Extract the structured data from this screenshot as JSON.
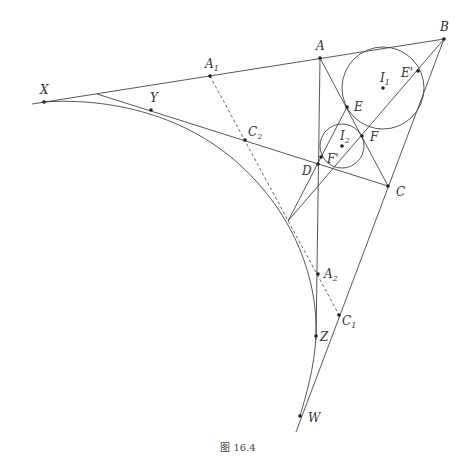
{
  "figure": {
    "caption": "图 16.4",
    "points": {
      "A": {
        "label": "A",
        "sub": "",
        "x": 320,
        "y": 58,
        "lx": 316,
        "ly": 50
      },
      "B": {
        "label": "B",
        "sub": "",
        "x": 444,
        "y": 39,
        "lx": 440,
        "ly": 31
      },
      "C": {
        "label": "C",
        "sub": "",
        "x": 388,
        "y": 186,
        "lx": 396,
        "ly": 196
      },
      "D": {
        "label": "D",
        "sub": "",
        "x": 318,
        "y": 164,
        "lx": 302,
        "ly": 175
      },
      "E": {
        "label": "E",
        "sub": "",
        "x": 347,
        "y": 107,
        "lx": 354,
        "ly": 111
      },
      "F": {
        "label": "F",
        "sub": "",
        "x": 362,
        "y": 136,
        "lx": 370,
        "ly": 141
      },
      "E'": {
        "label": "E'",
        "sub": "",
        "x": 418,
        "y": 71,
        "lx": 401,
        "ly": 77
      },
      "F'": {
        "label": "F'",
        "sub": "",
        "x": 321,
        "y": 157,
        "lx": 327,
        "ly": 163
      },
      "I1": {
        "label": "I",
        "sub": "1",
        "x": 383,
        "y": 88,
        "lx": 380,
        "ly": 82
      },
      "I2": {
        "label": "I",
        "sub": "2",
        "x": 342,
        "y": 146,
        "lx": 340,
        "ly": 140
      },
      "X": {
        "label": "X",
        "sub": "",
        "x": 44,
        "y": 102,
        "lx": 40,
        "ly": 94
      },
      "Y": {
        "label": "Y",
        "sub": "",
        "x": 151,
        "y": 110,
        "lx": 150,
        "ly": 102
      },
      "A1": {
        "label": "A",
        "sub": "1",
        "x": 210,
        "y": 76,
        "lx": 205,
        "ly": 68
      },
      "C2": {
        "label": "C",
        "sub": "2",
        "x": 245,
        "y": 140,
        "lx": 248,
        "ly": 136
      },
      "A2": {
        "label": "A",
        "sub": "2",
        "x": 318,
        "y": 274,
        "lx": 324,
        "ly": 278
      },
      "C1": {
        "label": "C",
        "sub": "1",
        "x": 339,
        "y": 315,
        "lx": 342,
        "ly": 325
      },
      "Z": {
        "label": "Z",
        "sub": "",
        "x": 316,
        "y": 336,
        "lx": 320,
        "ly": 341
      },
      "W": {
        "label": "W",
        "sub": "",
        "x": 300,
        "y": 416,
        "lx": 308,
        "ly": 422
      }
    },
    "circles": [
      {
        "name": "incircle-I1",
        "cx": 383,
        "cy": 88,
        "r": 41
      },
      {
        "name": "incircle-I2",
        "cx": 342,
        "cy": 146,
        "r": 22
      }
    ]
  }
}
